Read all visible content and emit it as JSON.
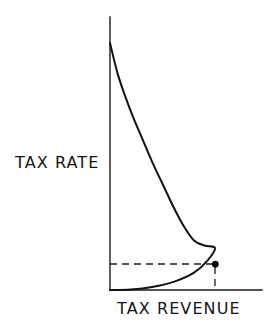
{
  "figure": {
    "kind": "laffer-curve-diagram",
    "background_color": "#ffffff",
    "line_color": "#111111",
    "dot_color": "#000000",
    "dash_color": "#1a1a1a"
  },
  "labels": {
    "y_axis": "TAX RATE",
    "x_axis": "TAX REVENUE"
  },
  "chart_data": {
    "type": "line",
    "title": "",
    "xlabel": "TAX REVENUE",
    "ylabel": "TAX RATE",
    "grid": false,
    "legend": "none",
    "axis_ticks": [],
    "xlim": [
      0,
      1
    ],
    "ylim": [
      0,
      1
    ],
    "annotations": [
      {
        "name": "revenue-maximizing-point",
        "marker": "filled-dot",
        "x": 1.0,
        "y": 0.17
      },
      {
        "name": "horizontal-guide-dash",
        "from": [
          0.0,
          0.17
        ],
        "to": [
          1.0,
          0.17
        ]
      },
      {
        "name": "vertical-guide-dash",
        "from": [
          1.0,
          0.17
        ],
        "to": [
          1.0,
          0.0
        ]
      }
    ],
    "series": [
      {
        "name": "Laffer curve",
        "description": "Tax revenue as a function of tax rate; revenue is zero at a 0% rate and at a 100% rate, peaking at an intermediate rate.",
        "points": [
          [
            0.0,
            1.0
          ],
          [
            0.07,
            0.88
          ],
          [
            0.14,
            0.79
          ],
          [
            0.22,
            0.7
          ],
          [
            0.31,
            0.61
          ],
          [
            0.4,
            0.52
          ],
          [
            0.5,
            0.43
          ],
          [
            0.6,
            0.34
          ],
          [
            0.7,
            0.26
          ],
          [
            0.8,
            0.2
          ],
          [
            0.9,
            0.18
          ],
          [
            1.0,
            0.17
          ],
          [
            0.93,
            0.12
          ],
          [
            0.8,
            0.07
          ],
          [
            0.62,
            0.035
          ],
          [
            0.4,
            0.012
          ],
          [
            0.2,
            0.002
          ],
          [
            0.0,
            0.0
          ]
        ]
      }
    ]
  },
  "geometry": {
    "y_axis": {
      "x": 110,
      "y_top": 17,
      "y_bottom": 290
    },
    "x_axis": {
      "y": 290,
      "x_left": 110,
      "x_right": 262
    },
    "curve_top_anchor": {
      "x": 110,
      "y": 43
    },
    "curve_peak": {
      "x": 215,
      "y": 264
    },
    "curve_bottom_anchor": {
      "x": 112,
      "y": 289
    }
  }
}
